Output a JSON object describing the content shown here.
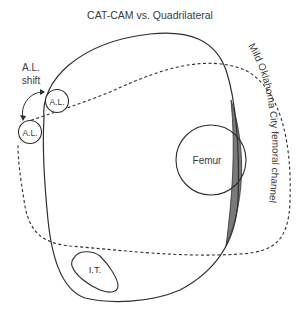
{
  "title": "CAT-CAM vs. Quadrilateral",
  "labels": {
    "al_shift_line1": "A.L.",
    "al_shift_line2": "shift",
    "al_upper": "A.L.",
    "al_lower": "A.L.",
    "femur": "Femur",
    "it": "I.T.",
    "channel": "Mild Oklahoma City femoral channel"
  },
  "legend_semantics": {
    "solid_outline": "CAT-CAM socket outline",
    "dashed_outline": "Quadrilateral socket outline"
  },
  "colors": {
    "stroke": "#2e2e2e",
    "text": "#3a3a3a",
    "shaded_channel": "#7a7a7a",
    "background": "#ffffff"
  }
}
